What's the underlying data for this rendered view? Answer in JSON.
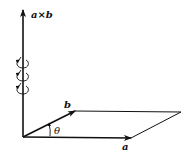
{
  "diagram": {
    "labels": {
      "cross": "a×b",
      "a": "a",
      "b": "b",
      "theta": "θ"
    },
    "colors": {
      "stroke": "#111111",
      "background": "#ffffff"
    },
    "elements": {
      "origin": [
        23,
        137
      ],
      "vector_a_tip": [
        131,
        138
      ],
      "vector_b_tip": [
        75,
        111
      ],
      "parallelogram_far_corner": [
        181,
        112
      ],
      "cross_axis_tip": [
        23,
        8
      ],
      "curl_count": 3
    }
  }
}
